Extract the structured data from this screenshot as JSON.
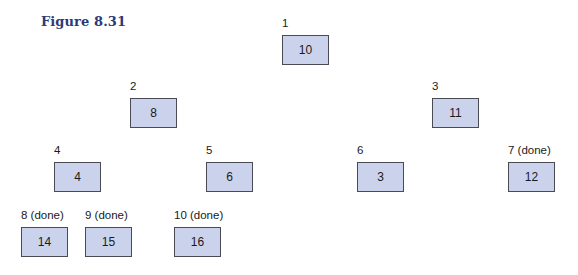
{
  "figure": {
    "title": "Figure 8.31"
  },
  "nodes": [
    {
      "index_label": "1",
      "value": "10",
      "x": 282,
      "y": 17
    },
    {
      "index_label": "2",
      "value": "8",
      "x": 130,
      "y": 80
    },
    {
      "index_label": "3",
      "value": "11",
      "x": 432,
      "y": 80
    },
    {
      "index_label": "4",
      "value": "4",
      "x": 54,
      "y": 144
    },
    {
      "index_label": "5",
      "value": "6",
      "x": 206,
      "y": 144
    },
    {
      "index_label": "6",
      "value": "3",
      "x": 357,
      "y": 144
    },
    {
      "index_label": "7 (done)",
      "value": "12",
      "x": 508,
      "y": 144
    },
    {
      "index_label": "8 (done)",
      "value": "14",
      "x": 21,
      "y": 209
    },
    {
      "index_label": "9 (done)",
      "value": "15",
      "x": 85,
      "y": 209
    },
    {
      "index_label": "10 (done)",
      "value": "16",
      "x": 174,
      "y": 209
    }
  ],
  "colors": {
    "box_fill": "#cbd3ec",
    "box_border": "#4a4a52",
    "title": "#2c3a78"
  }
}
